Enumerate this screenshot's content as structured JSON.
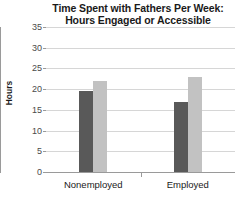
{
  "chart_data": {
    "type": "bar",
    "title": "Time Spent with Fathers Per Week: Hours Engaged or Accessible",
    "title_line1": "Time Spent with Fathers Per Week:",
    "title_line2": "Hours Engaged or Accessible",
    "xlabel": "",
    "ylabel": "Hours",
    "ylim": [
      0,
      35
    ],
    "ytick_values": [
      0,
      5,
      10,
      15,
      20,
      25,
      30,
      35
    ],
    "ytick_labels": [
      "0",
      "5",
      "10",
      "15",
      "20",
      "25",
      "30",
      "35"
    ],
    "categories": [
      "Nonemployed",
      "Employed"
    ],
    "grid": "horizontal",
    "legend": "none",
    "series": [
      {
        "name": "Engaged",
        "color": "#595959",
        "values": [
          19.5,
          17
        ]
      },
      {
        "name": "Accessible",
        "color": "#c2c2c2",
        "values": [
          22,
          23
        ]
      }
    ],
    "colors": {
      "dark_bar": "#595959",
      "light_bar": "#c2c2c2",
      "gridline": "#d6d6d6",
      "axis": "#9a9a9a",
      "text": "#1a1a1a",
      "background": "#ffffff"
    }
  }
}
